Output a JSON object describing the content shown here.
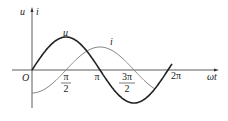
{
  "chart_data": {
    "type": "line",
    "title": "",
    "xlabel": "ωt",
    "ylabel": "u i",
    "origin_label": "O",
    "x_ticks": [
      "π/2",
      "π",
      "3π/2",
      "2π"
    ],
    "series": [
      {
        "name": "u",
        "function": "sin(ωt)",
        "x": [
          0,
          0.5,
          1,
          1.5,
          2
        ],
        "x_unit": "π",
        "values": [
          0,
          1,
          0,
          -1,
          0
        ],
        "color": "#222222",
        "width": 1.6
      },
      {
        "name": "i",
        "function": "sin(ωt - π/2)",
        "x": [
          0,
          0.5,
          1,
          1.5,
          2
        ],
        "x_unit": "π",
        "values": [
          -0.7,
          0,
          0.7,
          0,
          -0.7
        ],
        "color": "#888888",
        "width": 1.0
      }
    ],
    "grid": false
  },
  "labels": {
    "y_axis": "u",
    "y_axis2": "i",
    "x_axis": "ωt",
    "origin": "O",
    "curve_u": "u",
    "curve_i": "i",
    "tick_half_pi_top": "π",
    "tick_half_pi_bottom": "2",
    "tick_pi": "π",
    "tick_3half_pi_top": "3π",
    "tick_3half_pi_bottom": "2",
    "tick_2pi": "2π"
  }
}
